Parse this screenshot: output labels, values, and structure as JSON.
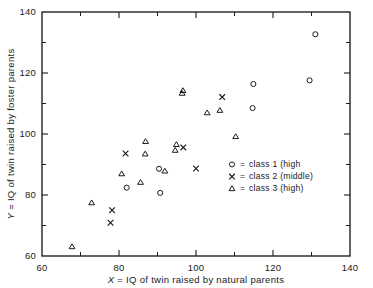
{
  "chart_data": {
    "type": "scatter",
    "title": "",
    "xlabel": "X = IQ of twin raised by natural parents",
    "ylabel": "Y = IQ of twin raised by foster parents",
    "xlabel_symbol": "X",
    "xlabel_rest": " =  IQ of twin raised by natural parents",
    "ylabel_symbol": "Y",
    "ylabel_rest": " =  IQ of twin raised by foster parents",
    "xlim": [
      60,
      140
    ],
    "ylim": [
      60,
      140
    ],
    "xticks": [
      60,
      80,
      100,
      120,
      140
    ],
    "yticks": [
      60,
      80,
      100,
      120,
      140
    ],
    "xticks_minor": [
      70,
      90,
      110,
      130
    ],
    "yticks_minor": [
      70,
      90,
      110,
      130
    ],
    "xtick_labels": [
      "60",
      "80",
      "100",
      "120",
      "140"
    ],
    "ytick_labels": [
      "60",
      "80",
      "100",
      "120",
      "140"
    ],
    "grid": false,
    "legend_position": "center-right-inside",
    "series": [
      {
        "name": "class 1 (high",
        "legend_label": "= class 1 (high",
        "marker": "circle",
        "color": "#1a1a1a",
        "points": [
          [
            82.0,
            82.4
          ],
          [
            90.4,
            88.6
          ],
          [
            90.7,
            80.7
          ],
          [
            114.9,
            116.4
          ],
          [
            114.7,
            108.5
          ],
          [
            129.5,
            117.6
          ],
          [
            131.0,
            132.7
          ]
        ]
      },
      {
        "name": "class 2 (middle)",
        "legend_label": "= class 2 (middle)",
        "marker": "x",
        "color": "#1a1a1a",
        "points": [
          [
            77.8,
            70.9
          ],
          [
            78.2,
            75.0
          ],
          [
            81.7,
            93.6
          ],
          [
            96.7,
            95.6
          ],
          [
            100.0,
            88.7
          ],
          [
            106.8,
            112.1
          ]
        ]
      },
      {
        "name": "class 3 (high)",
        "legend_label": "= class 3 (high)",
        "marker": "triangle",
        "color": "#1a1a1a",
        "points": [
          [
            67.8,
            63.0
          ],
          [
            72.9,
            77.4
          ],
          [
            80.7,
            86.9
          ],
          [
            85.6,
            84.1
          ],
          [
            86.9,
            97.5
          ],
          [
            86.8,
            93.4
          ],
          [
            91.9,
            87.8
          ],
          [
            94.6,
            94.6
          ],
          [
            94.9,
            96.5
          ],
          [
            96.4,
            113.3
          ],
          [
            96.6,
            114.2
          ],
          [
            102.9,
            106.9
          ],
          [
            106.2,
            107.7
          ],
          [
            110.3,
            99.1
          ]
        ]
      }
    ]
  },
  "legend": {
    "entries": [
      {
        "marker": "circle",
        "equals": "=",
        "label": "class 1 (high"
      },
      {
        "marker": "x",
        "equals": "=",
        "label": "class 2 (middle)"
      },
      {
        "marker": "triangle",
        "equals": "=",
        "label": "class 3 (high)"
      }
    ]
  }
}
